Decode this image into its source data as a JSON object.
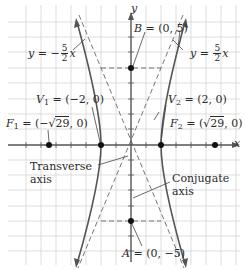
{
  "diagram": {
    "type": "hyperbola",
    "equation_center": [
      0,
      0
    ],
    "a": 2,
    "b": 5,
    "c_label": "√29",
    "axes": {
      "x_label": "x",
      "y_label": "y"
    },
    "asymptotes": [
      {
        "id": "neg",
        "prefix": "y = −",
        "num": "5",
        "den": "2",
        "var": "x"
      },
      {
        "id": "pos",
        "prefix": "y = ",
        "num": "5",
        "den": "2",
        "var": "x"
      }
    ],
    "points": {
      "B": {
        "name": "B",
        "coords": "= (0, 5)",
        "x": 0,
        "y": 5
      },
      "A": {
        "name": "A",
        "coords": "= (0, −5)",
        "x": 0,
        "y": -5
      },
      "V1": {
        "name": "V",
        "sub": "1",
        "coords": "= (−2, 0)",
        "x": -2,
        "y": 0
      },
      "V2": {
        "name": "V",
        "sub": "2",
        "coords": "= (2, 0)",
        "x": 2,
        "y": 0
      },
      "F1": {
        "name": "F",
        "sub": "1",
        "pre": "= (−",
        "root": "29",
        "post": ", 0)",
        "x": -5.385,
        "y": 0
      },
      "F2": {
        "name": "F",
        "sub": "2",
        "pre": "= (",
        "root": "29",
        "post": ", 0)",
        "x": 5.385,
        "y": 0
      }
    },
    "annotations": {
      "transverse": [
        "Transverse",
        "axis"
      ],
      "conjugate": [
        "Conjugate",
        "axis"
      ]
    },
    "colors": {
      "grid": "#d4d4d4",
      "axis": "#555555",
      "curve": "#555555",
      "dashed": "#666666",
      "point": "#111111",
      "text": "#2a2a2a"
    }
  }
}
